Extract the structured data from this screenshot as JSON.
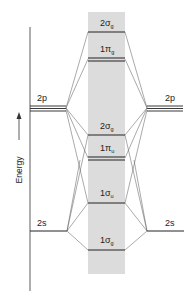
{
  "diagram": {
    "type": "molecular-orbital-energy-diagram",
    "axis_label": "Energy",
    "axis_arrow": "up",
    "colors": {
      "band": "#dcdcdc",
      "level": "#222222",
      "connector": "#555555",
      "axis": "#333333",
      "text": "#222222"
    },
    "atomic_orbitals_left": [
      {
        "label": "2p",
        "degenerate": 3
      },
      {
        "label": "2s",
        "degenerate": 1
      }
    ],
    "atomic_orbitals_right": [
      {
        "label": "2p",
        "degenerate": 3
      },
      {
        "label": "2s",
        "degenerate": 1
      }
    ],
    "molecular_orbitals": [
      {
        "label": "2σg",
        "main": "2σ",
        "sub": "g",
        "degenerate": 1,
        "order": 6
      },
      {
        "label": "1πg",
        "main": "1π",
        "sub": "g",
        "degenerate": 2,
        "order": 5
      },
      {
        "label": "2σg",
        "main": "2σ",
        "sub": "g",
        "degenerate": 1,
        "order": 4
      },
      {
        "label": "1πu",
        "main": "1π",
        "sub": "u",
        "degenerate": 2,
        "order": 3
      },
      {
        "label": "1σu",
        "main": "1σ",
        "sub": "u",
        "degenerate": 1,
        "order": 2
      },
      {
        "label": "1σg",
        "main": "1σ",
        "sub": "g",
        "degenerate": 1,
        "order": 1
      }
    ]
  },
  "labels": {
    "left_2p": "2p",
    "right_2p": "2p",
    "left_2s": "2s",
    "right_2s": "2s",
    "energy": "Energy",
    "mo_top_main": "2σ",
    "mo_top_sub": "g",
    "mo_pig_main": "1π",
    "mo_pig_sub": "g",
    "mo_sig2_main": "2σ",
    "mo_sig2_sub": "g",
    "mo_piu_main": "1π",
    "mo_piu_sub": "u",
    "mo_sig1u_main": "1σ",
    "mo_sig1u_sub": "u",
    "mo_sig1g_main": "1σ",
    "mo_sig1g_sub": "g"
  }
}
